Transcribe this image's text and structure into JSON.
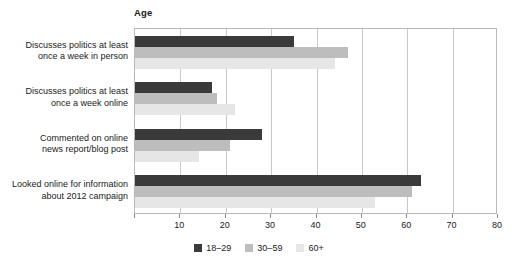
{
  "chart_data": {
    "type": "bar",
    "orientation": "horizontal",
    "title": "",
    "legend_title": "Age",
    "legend_position": "bottom",
    "xlabel": "",
    "ylabel": "",
    "xlim": [
      0,
      80
    ],
    "xticks": [
      0,
      10,
      20,
      30,
      40,
      50,
      60,
      70,
      80
    ],
    "xtick_labels": [
      "",
      "10",
      "20",
      "30",
      "40",
      "50",
      "60",
      "70",
      "80"
    ],
    "grid": true,
    "categories": [
      "Discusses politics at least once a week in person",
      "Discusses politics at least once a week online",
      "Commented on online news report/blog post",
      "Looked online for information about 2012 campaign"
    ],
    "category_lines": [
      [
        "Discusses politics at least",
        "once a week in person"
      ],
      [
        "Discusses politics at least",
        "once a week online"
      ],
      [
        "Commented on online",
        "news report/blog post"
      ],
      [
        "Looked online for information",
        "about 2012 campaign"
      ]
    ],
    "series": [
      {
        "name": "18–29",
        "color": "#3a3a3a",
        "values": [
          35,
          17,
          28,
          63
        ]
      },
      {
        "name": "30–59",
        "color": "#bdbdbd",
        "values": [
          47,
          18,
          21,
          61
        ]
      },
      {
        "name": "60+",
        "color": "#e6e6e6",
        "values": [
          44,
          22,
          14,
          53
        ]
      }
    ]
  },
  "colors": {
    "axis": "#b9b9b9",
    "gridline": "#c8c8c8",
    "text": "#1a1a1a",
    "background": "#ffffff"
  }
}
